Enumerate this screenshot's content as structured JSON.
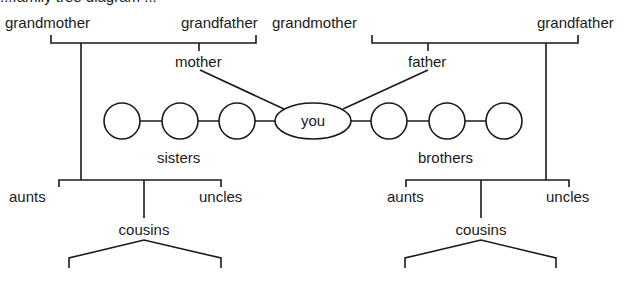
{
  "diagram": {
    "clipped_caption": "...family tree diagram ...",
    "left_side": {
      "grandmother": "grandmother",
      "grandfather": "grandfather",
      "parent": "mother",
      "siblings": "sisters",
      "aunts": "aunts",
      "uncles": "uncles",
      "cousins": "cousins"
    },
    "right_side": {
      "grandmother": "grandmother",
      "grandfather": "grandfather",
      "parent": "father",
      "siblings": "brothers",
      "aunts": "aunts",
      "uncles": "uncles",
      "cousins": "cousins"
    },
    "center": "you",
    "colors": {
      "line": "#1a1a1a",
      "background": "#ffffff"
    }
  }
}
